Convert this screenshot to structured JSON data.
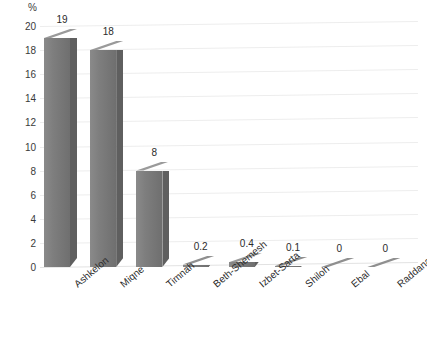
{
  "chart_data": {
    "type": "bar",
    "title": "",
    "subtitle": "",
    "xlabel": "",
    "ylabel": "%",
    "unit_label": "%",
    "categories": [
      "Ashkelon",
      "Miqne",
      "Timnah",
      "Beth-Shemesh",
      "Izbet-Sarta",
      "Shiloh",
      "Ebal",
      "Raddana"
    ],
    "values": [
      19,
      18,
      8,
      0.2,
      0.4,
      0.1,
      0,
      0
    ],
    "value_labels": [
      "19",
      "18",
      "8",
      "0.2",
      "0.4",
      "0.1",
      "0",
      "0"
    ],
    "ylim": [
      0,
      20
    ],
    "yticks": [
      0,
      2,
      4,
      6,
      8,
      10,
      12,
      14,
      16,
      18,
      20
    ],
    "ytick_labels": [
      "0",
      "2",
      "4",
      "6",
      "8",
      "10",
      "12",
      "14",
      "16",
      "18",
      "20"
    ],
    "grid": true,
    "grid_axis": "y",
    "legend": false,
    "legend_position": "none",
    "style": "3d-column",
    "bar_color": "#7e7e7e",
    "bar_top_color": "#9a9a9a",
    "bar_side_color": "#5f5f5f",
    "grid_color": "#ededed",
    "background_color": "#ffffff",
    "text_color": "#2b2b2b"
  }
}
